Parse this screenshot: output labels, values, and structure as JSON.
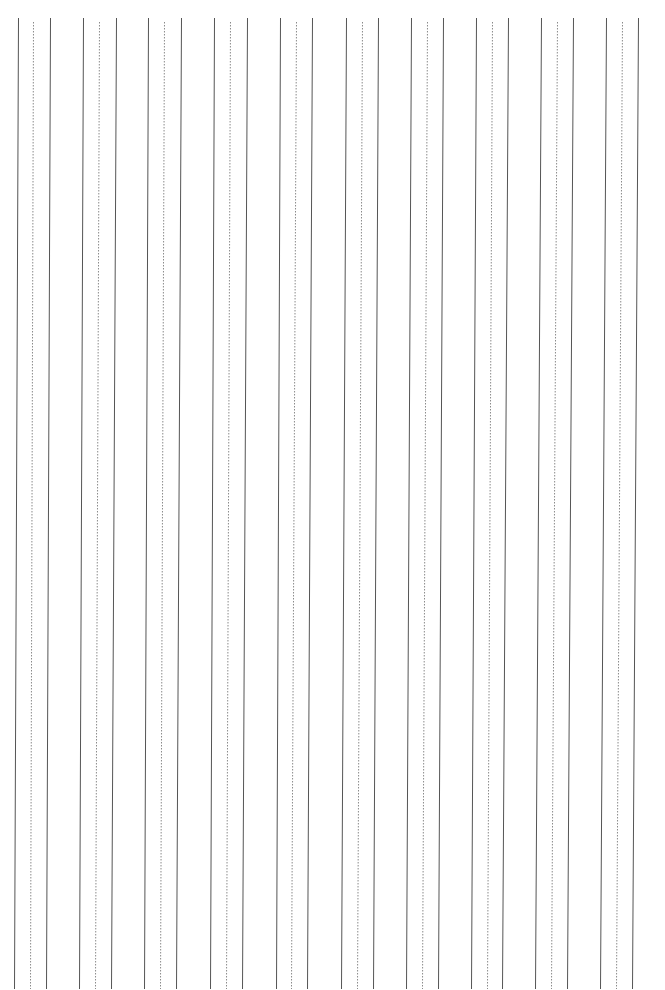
{
  "page": {
    "width": 665,
    "height": 990,
    "background": "#ffffff"
  },
  "style": {
    "solid_color": "#555555",
    "solid_width": 1,
    "dotted_color": "#8a8a8a",
    "dotted_width": 1,
    "dotted_dash": "1.5,1.5"
  },
  "lines": {
    "y_top": 18,
    "y_bottom": 989,
    "dotted_y_top": 22,
    "groups": [
      {
        "top": [
          18,
          33,
          50
        ],
        "bottom": [
          14,
          30,
          46
        ]
      },
      {
        "top": [
          83,
          99,
          116
        ],
        "bottom": [
          79,
          95,
          111
        ]
      },
      {
        "top": [
          148,
          164,
          181
        ],
        "bottom": [
          144,
          160,
          176
        ]
      },
      {
        "top": [
          214,
          230,
          247
        ],
        "bottom": [
          210,
          226,
          242
        ]
      },
      {
        "top": [
          280,
          296,
          312
        ],
        "bottom": [
          276,
          291,
          307
        ]
      },
      {
        "top": [
          346,
          362,
          378
        ],
        "bottom": [
          341,
          357,
          373
        ]
      },
      {
        "top": [
          411,
          427,
          443
        ],
        "bottom": [
          406,
          422,
          438
        ]
      },
      {
        "top": [
          476,
          492,
          508
        ],
        "bottom": [
          471,
          487,
          502
        ]
      },
      {
        "top": [
          541,
          557,
          573
        ],
        "bottom": [
          535,
          551,
          567
        ]
      },
      {
        "top": [
          606,
          622,
          638
        ],
        "bottom": [
          600,
          616,
          632
        ]
      }
    ]
  }
}
